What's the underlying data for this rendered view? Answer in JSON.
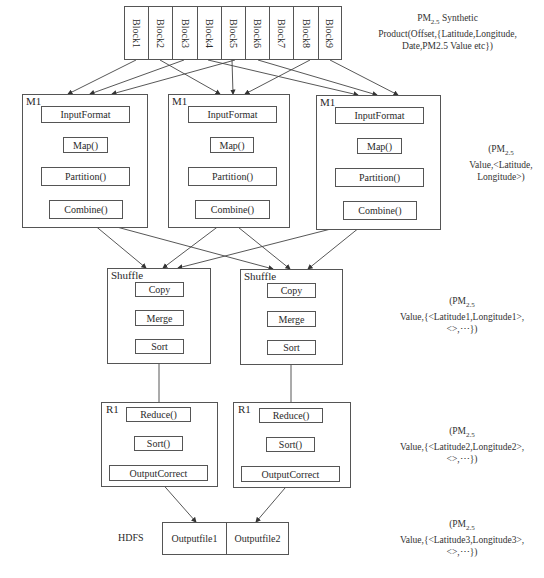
{
  "blocks": [
    "Block1",
    "Block2",
    "Block3",
    "Block4",
    "Block5",
    "Block6",
    "Block7",
    "Block8",
    "Block9"
  ],
  "map_nodes": [
    {
      "title": "M1",
      "steps": [
        "InputFormat",
        "Map()",
        "Partition()",
        "Combine()"
      ]
    },
    {
      "title": "M1",
      "steps": [
        "InputFormat",
        "Map()",
        "Partition()",
        "Combine()"
      ]
    },
    {
      "title": "M1",
      "steps": [
        "InputFormat",
        "Map()",
        "Partition()",
        "Combine()"
      ]
    }
  ],
  "shuffle_nodes": [
    {
      "title": "Shuffle",
      "steps": [
        "Copy",
        "Merge",
        "Sort"
      ]
    },
    {
      "title": "Shuffle",
      "steps": [
        "Copy",
        "Merge",
        "Sort"
      ]
    }
  ],
  "reduce_nodes": [
    {
      "title": "R1",
      "steps": [
        "Reduce()",
        "Sort()",
        "OutputCorrect"
      ]
    },
    {
      "title": "R1",
      "steps": [
        "Reduce()",
        "Sort()",
        "OutputCorrect"
      ]
    }
  ],
  "hdfs": {
    "label": "HDFS",
    "files": [
      "Outputfile1",
      "Outputfile2"
    ]
  },
  "annotations": {
    "input": {
      "line1_pre": "PM",
      "line1_sub": "2.5",
      "line1_post": " Synthetic",
      "line2": "Product(Offset,{Latitude,Longitude,",
      "line3": "Date,PM2.5 Value etc})"
    },
    "map_output": {
      "line1_pre": "(PM",
      "line1_sub": "2.5",
      "line2": "Value,<Latitude,",
      "line3": "Longitude>)"
    },
    "shuffle_output": {
      "line1_pre": "(PM",
      "line1_sub": "2.5",
      "line2": "Value,{<Latitude1,Longitude1>,",
      "line3": "<>,⋯})"
    },
    "reduce_output": {
      "line1_pre": "(PM",
      "line1_sub": "2.5",
      "line2": "Value,{<Latitude2,Longitude2>,",
      "line3": "<>,⋯})"
    },
    "hdfs_output": {
      "line1_pre": "(PM",
      "line1_sub": "2.5",
      "line2": "Value,{<Latitude3,Longitude3>,",
      "line3": "<>,⋯})"
    }
  },
  "colors": {
    "line": "#444444",
    "box_border": "#555555",
    "text": "#2a2a2a",
    "background": "#ffffff"
  }
}
